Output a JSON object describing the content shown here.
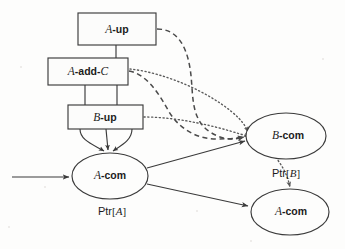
{
  "figure": {
    "kind": "node-graph-diagram",
    "background_color": "#fdfdfc",
    "ink_color": "#3b3b3b",
    "width": 345,
    "height": 249
  },
  "nodes": {
    "boxes": [
      {
        "id": "a-up",
        "shape": "rectangle",
        "label_plain": "A-up",
        "label_italic_part": "A",
        "label_bold_part": "-up",
        "x": 78,
        "y": 13,
        "w": 78,
        "h": 32
      },
      {
        "id": "a-add-c",
        "shape": "rectangle",
        "label_plain": "A-add-C",
        "label_italic_part": "A",
        "label_bold_part": "-add-",
        "label_italic_tail": "C",
        "x": 48,
        "y": 58,
        "w": 80,
        "h": 27
      },
      {
        "id": "b-up",
        "shape": "rectangle",
        "label_plain": "B-up",
        "label_italic_part": "B",
        "label_bold_part": "-up",
        "x": 68,
        "y": 105,
        "w": 75,
        "h": 24
      }
    ],
    "ellipses": [
      {
        "id": "a-com-left",
        "shape": "ellipse",
        "label_plain": "A-com",
        "label_italic_part": "A",
        "label_bold_part": "-com",
        "cx": 110,
        "cy": 176,
        "rx": 38,
        "ry": 23,
        "pointer_label": "Ptr[A]",
        "pointer_bracket_letter": "A",
        "pointer_x": 112,
        "pointer_y": 212
      },
      {
        "id": "b-com",
        "shape": "ellipse",
        "label_plain": "B-com",
        "label_italic_part": "B",
        "label_bold_part": "-com",
        "cx": 286,
        "cy": 136,
        "rx": 40,
        "ry": 23,
        "pointer_label": "Ptr[B]",
        "pointer_bracket_letter": "B",
        "pointer_x": 286,
        "pointer_y": 174
      },
      {
        "id": "a-com-right",
        "shape": "ellipse",
        "label_plain": "A-com",
        "label_italic_part": "A",
        "label_bold_part": "-com",
        "cx": 290,
        "cy": 212,
        "rx": 39,
        "ry": 23,
        "pointer_label": "",
        "pointer_bracket_letter": "",
        "pointer_x": 0,
        "pointer_y": 0
      }
    ]
  },
  "edges": {
    "solid": [
      {
        "id": "incoming-arrow",
        "from": "external-left",
        "to": "a-com-left",
        "style": "solid",
        "arrow": true
      },
      {
        "id": "a-up-to-a-add-c",
        "from": "a-up",
        "to": "a-add-c",
        "style": "solid",
        "arrow": false
      },
      {
        "id": "a-add-c-to-b-up-left",
        "from": "a-add-c",
        "to": "b-up",
        "style": "solid",
        "arrow": false
      },
      {
        "id": "a-add-c-to-b-up-right",
        "from": "a-add-c",
        "to": "b-up",
        "style": "solid",
        "arrow": false
      },
      {
        "id": "b-up-to-a-com-1",
        "from": "b-up",
        "to": "a-com-left",
        "style": "solid",
        "arrow": true
      },
      {
        "id": "b-up-to-a-com-2",
        "from": "b-up",
        "to": "a-com-left",
        "style": "solid",
        "arrow": true
      },
      {
        "id": "b-up-to-a-com-3",
        "from": "b-up",
        "to": "a-com-left",
        "style": "solid",
        "arrow": true
      },
      {
        "id": "a-com-to-b-com",
        "from": "a-com-left",
        "to": "b-com",
        "style": "solid",
        "arrow": true
      },
      {
        "id": "a-com-to-a-com-right",
        "from": "a-com-left",
        "to": "a-com-right",
        "style": "solid",
        "arrow": true
      }
    ],
    "dashed": [
      {
        "id": "a-up-to-b-com",
        "from": "a-up",
        "to": "b-com",
        "style": "dashed",
        "arrow": true
      },
      {
        "id": "a-add-c-to-b-com-dashed",
        "from": "a-add-c",
        "to": "b-com",
        "style": "dashed",
        "arrow": true
      }
    ],
    "dotted": [
      {
        "id": "a-add-c-to-b-com-dotted",
        "from": "a-add-c",
        "to": "b-com",
        "style": "dotted",
        "arrow": true
      },
      {
        "id": "b-up-to-b-com-dotted",
        "from": "b-up",
        "to": "b-com",
        "style": "dotted",
        "arrow": true
      },
      {
        "id": "b-com-to-a-com-right-dotted",
        "from": "b-com",
        "to": "a-com-right",
        "style": "dotted",
        "arrow": true
      }
    ]
  }
}
